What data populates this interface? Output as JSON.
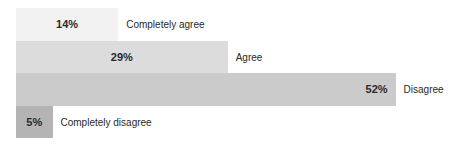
{
  "chart_data": {
    "type": "bar",
    "orientation": "horizontal",
    "title": "",
    "xlabel": "",
    "ylabel": "",
    "xlim": [
      0,
      100
    ],
    "grid": false,
    "legend": "none",
    "categories": [
      "Completely agree",
      "Agree",
      "Disagree",
      "Completely disagree"
    ],
    "values": [
      14,
      29,
      52,
      5
    ],
    "value_labels": [
      "14%",
      "29%",
      "52%",
      "5%"
    ],
    "colors": [
      "#f2f2f2",
      "#dcdcdc",
      "#cbcbcb",
      "#b4b4b4"
    ]
  }
}
